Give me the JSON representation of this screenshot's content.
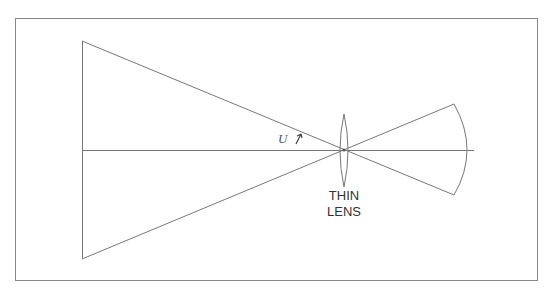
{
  "diagram": {
    "type": "optics-ray-diagram",
    "angle_label": "U",
    "lens_label_line1": "THIN",
    "lens_label_line2": "LENS",
    "colors": {
      "stroke": "#666666",
      "border": "#888888",
      "background": "#ffffff"
    }
  }
}
